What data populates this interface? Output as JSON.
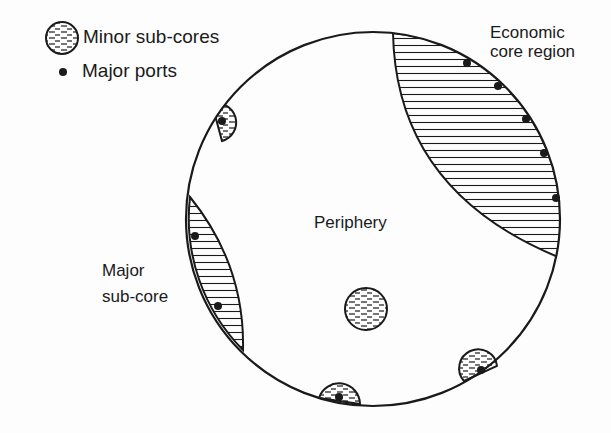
{
  "legend": {
    "items": [
      {
        "symbol": "hatched-circle",
        "label": "Minor sub-cores"
      },
      {
        "symbol": "dot",
        "label": "Major ports"
      }
    ]
  },
  "labels": {
    "economic_core_line1": "Economic",
    "economic_core_line2": "core region",
    "periphery": "Periphery",
    "major_subcore_line1": "Major",
    "major_subcore_line2": "sub-core"
  },
  "colors": {
    "ink": "#1a1a1a",
    "background": "#fdfdfd"
  }
}
